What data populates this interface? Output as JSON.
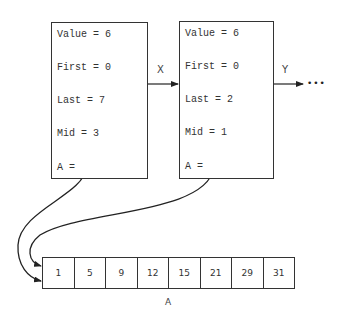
{
  "frames": [
    {
      "fields": [
        "Value = 6",
        "First = 0",
        "Last = 7",
        "Mid = 3",
        "A ="
      ]
    },
    {
      "fields": [
        "Value = 6",
        "First = 0",
        "Last = 2",
        "Mid = 1",
        "A ="
      ]
    }
  ],
  "links": {
    "x_label": "X",
    "y_label": "Y",
    "ellipsis": "•••"
  },
  "array": {
    "name": "A",
    "values": [
      "1",
      "5",
      "9",
      "12",
      "15",
      "21",
      "29",
      "31"
    ]
  }
}
